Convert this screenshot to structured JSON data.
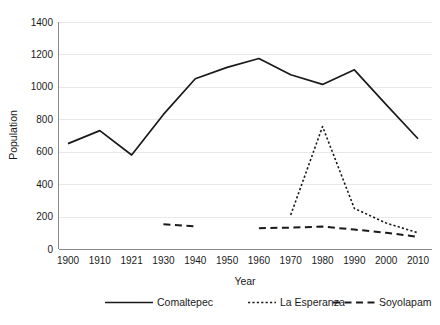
{
  "chart_data": {
    "type": "line",
    "title": "",
    "xlabel": "Year",
    "ylabel": "Population",
    "categories": [
      "1900",
      "1910",
      "1921",
      "1930",
      "1940",
      "1950",
      "1960",
      "1970",
      "1980",
      "1990",
      "2000",
      "2010"
    ],
    "ylim": [
      0,
      1400
    ],
    "yticks": [
      0,
      200,
      400,
      600,
      800,
      1000,
      1200,
      1400
    ],
    "ytick_labels": [
      "0",
      "200",
      "400",
      "600",
      "800",
      "1000",
      "1200",
      "1400"
    ],
    "grid": true,
    "legend_position": "bottom",
    "series": [
      {
        "name": "Comaltepec",
        "style": "solid",
        "values": [
          650,
          730,
          580,
          830,
          1050,
          1120,
          1175,
          1075,
          1015,
          1105,
          890,
          680
        ]
      },
      {
        "name": "La Esperanza",
        "style": "dotted",
        "values": [
          null,
          null,
          null,
          null,
          null,
          null,
          null,
          210,
          755,
          250,
          160,
          100
        ]
      },
      {
        "name": "Soyolapam",
        "style": "dashed",
        "values": [
          null,
          null,
          null,
          152,
          140,
          null,
          128,
          132,
          138,
          120,
          100,
          75
        ]
      }
    ]
  },
  "axes": {
    "y_axis_title": "Population",
    "x_axis_title": "Year"
  },
  "legend": {
    "items": [
      {
        "label": "Comaltepec",
        "style": "solid"
      },
      {
        "label": "La Esperanza",
        "style": "dotted"
      },
      {
        "label": "Soyolapam",
        "style": "dashed"
      }
    ]
  },
  "colors": {
    "line": "#1a1a1a",
    "grid": "#e8e8e8",
    "axis": "#8a8a8a",
    "background": "#ffffff"
  }
}
